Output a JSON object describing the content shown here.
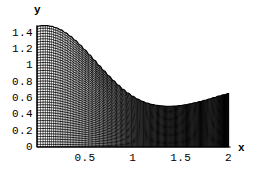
{
  "figure": {
    "background_color": "#ffffff",
    "ink_color": "#000000",
    "axis_label_x": "x",
    "axis_label_y": "y"
  },
  "chart_data": {
    "type": "area",
    "title": "",
    "subtitle": "",
    "xlabel": "x",
    "ylabel": "y",
    "xlim": [
      0,
      2.05
    ],
    "ylim": [
      0,
      1.55
    ],
    "grid": false,
    "legend": null,
    "fill_style": "dense-crosshatch-mesh",
    "fill_color": "#000000",
    "xticks": [
      0.5,
      1,
      1.5,
      2
    ],
    "xtick_labels": [
      "0.5",
      "1",
      "1.5",
      "2"
    ],
    "yticks": [
      0,
      0.2,
      0.4,
      0.6,
      0.8,
      1,
      1.2,
      1.4
    ],
    "ytick_labels": [
      "0",
      "0.2",
      "0.4",
      "0.6",
      "0.8",
      "1",
      "1.2",
      "1.4"
    ],
    "x_origin_label": "0",
    "series": [
      {
        "name": "curve",
        "x": [
          0.0,
          0.05,
          0.1,
          0.15,
          0.2,
          0.25,
          0.3,
          0.35,
          0.4,
          0.45,
          0.5,
          0.55,
          0.6,
          0.65,
          0.7,
          0.75,
          0.8,
          0.85,
          0.9,
          0.95,
          1.0,
          1.05,
          1.1,
          1.15,
          1.2,
          1.25,
          1.3,
          1.35,
          1.4,
          1.45,
          1.5,
          1.55,
          1.6,
          1.65,
          1.7,
          1.75,
          1.8,
          1.85,
          1.9,
          1.95,
          2.0
        ],
        "y": [
          1.48,
          1.487,
          1.488,
          1.48,
          1.462,
          1.436,
          1.4,
          1.357,
          1.307,
          1.251,
          1.191,
          1.128,
          1.063,
          0.998,
          0.934,
          0.872,
          0.812,
          0.757,
          0.706,
          0.661,
          0.621,
          0.587,
          0.56,
          0.538,
          0.522,
          0.511,
          0.504,
          0.5,
          0.5,
          0.503,
          0.509,
          0.518,
          0.529,
          0.542,
          0.556,
          0.572,
          0.589,
          0.607,
          0.625,
          0.641,
          0.655
        ]
      }
    ],
    "annotations": []
  },
  "ticks": {
    "y": [
      {
        "label": "1.4",
        "value": 1.4
      },
      {
        "label": "1.2",
        "value": 1.2
      },
      {
        "label": "1",
        "value": 1.0
      },
      {
        "label": "0.8",
        "value": 0.8
      },
      {
        "label": "0.6",
        "value": 0.6
      },
      {
        "label": "0.4",
        "value": 0.4
      },
      {
        "label": "0.2",
        "value": 0.2
      },
      {
        "label": "0",
        "value": 0.0
      }
    ],
    "x": [
      {
        "label": "0.5",
        "value": 0.5
      },
      {
        "label": "1",
        "value": 1.0
      },
      {
        "label": "1.5",
        "value": 1.5
      },
      {
        "label": "2",
        "value": 2.0
      }
    ]
  }
}
